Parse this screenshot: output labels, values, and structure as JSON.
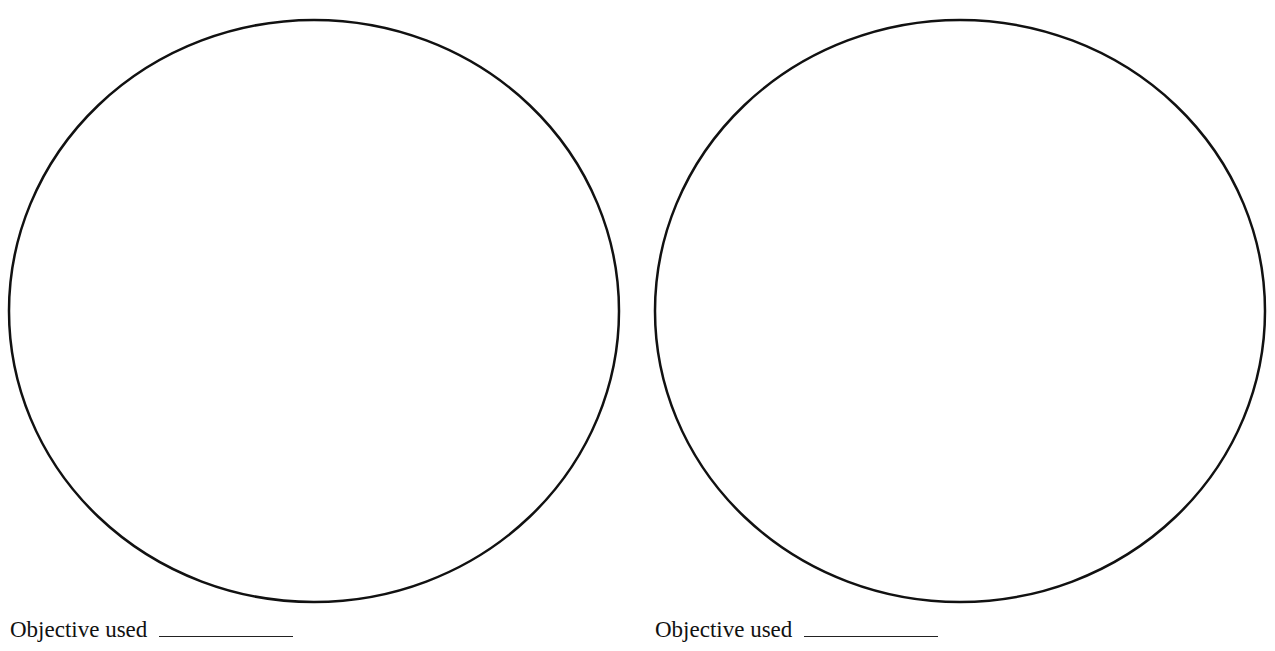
{
  "fields": [
    {
      "id": "left",
      "label": "Objective used",
      "blank_value": "",
      "circle": {
        "cx": 314,
        "cy": 311,
        "rx": 305,
        "ry": 291
      }
    },
    {
      "id": "right",
      "label": "Objective used",
      "blank_value": "",
      "circle": {
        "cx": 314,
        "cy": 311,
        "rx": 305,
        "ry": 291
      }
    }
  ],
  "colors": {
    "stroke": "#111111",
    "background": "#ffffff"
  }
}
